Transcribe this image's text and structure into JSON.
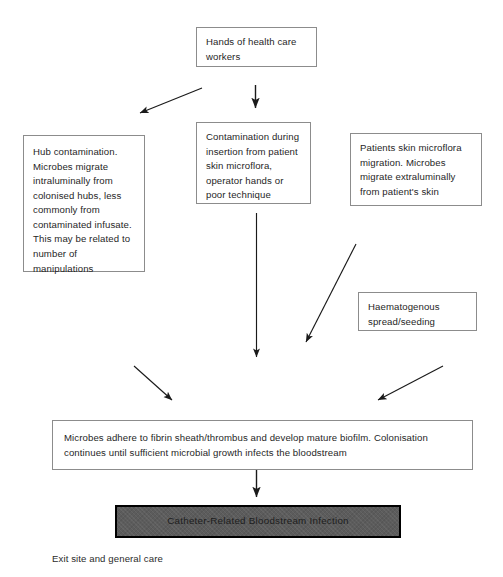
{
  "diagram": {
    "colors": {
      "page_background": "#ffffff",
      "box_border": "#8c8c8c",
      "box_fill": "#ffffff",
      "text": "#1f1f1f",
      "arrow": "#1a1a1a",
      "highlight_box_fill": "#5c5c5c",
      "highlight_box_border": "#000000"
    },
    "nodes": {
      "hands": "Hands of health care workers",
      "hub": "Hub contamination. Microbes migrate intraluminally from colonised hubs, less commonly from contaminated infusate. This may be related to number of manipulations",
      "insertion": "Contamination during insertion from patient skin microflora, operator hands or poor technique",
      "patient_skin": "Patients skin microflora migration. Microbes migrate extraluminally from patient's skin",
      "haematogenous": "Haematogenous spread/seeding",
      "biofilm": "Microbes adhere to fibrin sheath/thrombus and develop mature biofilm. Colonisation continues until sufficient microbial growth infects the bloodstream",
      "crbsi": "Catheter-Related Bloodstream Infection"
    },
    "caption": "Exit site and general care"
  }
}
